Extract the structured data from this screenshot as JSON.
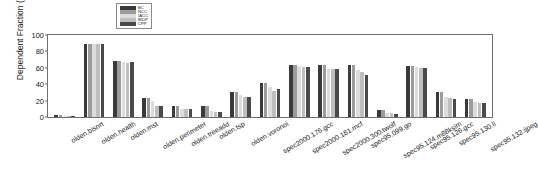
{
  "chart_data": {
    "type": "bar",
    "title": "",
    "xlabel": "",
    "ylabel": "Dependent Fraction (%)",
    "ylim": [
      0,
      100
    ],
    "yticks": [
      0,
      20,
      40,
      60,
      80,
      100
    ],
    "grid": false,
    "legend_position": "top-center",
    "categories": [
      "olden.bisort",
      "olden.health",
      "olden.mst",
      "olden.perimeter",
      "olden.treeadd",
      "olden.tsp",
      "olden.voronoi",
      "spec2000.176.gcc",
      "spec2000.181.mcf",
      "spec2000.300.twolf",
      "spec95.099.go",
      "spec95.124.m88ksim",
      "spec95.126.gcc",
      "spec95.130.li",
      "spec95.132.ijpeg"
    ],
    "series": [
      {
        "name": "BC",
        "color": "#3a3a3a",
        "values": [
          2,
          89,
          68,
          23,
          14,
          13,
          30,
          41,
          63,
          64,
          63,
          8,
          62,
          31,
          22
        ]
      },
      {
        "name": "NCC",
        "color": "#9c9c9c",
        "values": [
          2,
          89,
          68,
          23,
          14,
          13,
          30,
          41,
          64,
          64,
          64,
          8,
          62,
          31,
          22
        ]
      },
      {
        "name": "IACC",
        "color": "#dcdcdc",
        "values": [
          1,
          89,
          67,
          19,
          10,
          7,
          27,
          36,
          62,
          59,
          57,
          5,
          61,
          25,
          18
        ]
      },
      {
        "name": "BIDP",
        "color": "#bfbfbf",
        "values": [
          1,
          89,
          66,
          13,
          10,
          6,
          24,
          32,
          61,
          58,
          55,
          5,
          60,
          23,
          17
        ]
      },
      {
        "name": "CPP",
        "color": "#4a4a4a",
        "values": [
          1,
          89,
          67,
          13,
          10,
          6,
          25,
          34,
          61,
          59,
          51,
          4,
          60,
          22,
          17
        ]
      }
    ]
  },
  "axis": {
    "frame_color": "#6e6e6e"
  }
}
